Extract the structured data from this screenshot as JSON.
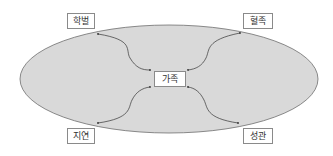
{
  "diagram": {
    "center": {
      "label": "가족"
    },
    "nodes": [
      {
        "id": "top-left",
        "label": "학벌"
      },
      {
        "id": "top-right",
        "label": "혈족"
      },
      {
        "id": "bottom-left",
        "label": "지연"
      },
      {
        "id": "bottom-right",
        "label": "성관"
      }
    ],
    "colors": {
      "ellipse_fill": "#d9d9d9",
      "ellipse_stroke": "#6e6e6e",
      "arrow": "#333333"
    }
  }
}
